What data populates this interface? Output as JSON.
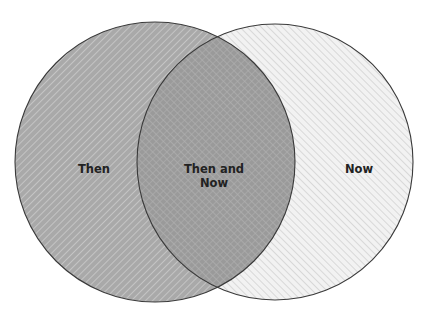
{
  "diagram": {
    "type": "venn",
    "sets": [
      {
        "id": "left",
        "label": "Then",
        "fill": "#a9a9a9",
        "hatch_color": "#c6c6c6",
        "hatch_direction": "backslash",
        "stroke": "#3a3a3a"
      },
      {
        "id": "right",
        "label": "Now",
        "fill": "#f1f1f1",
        "hatch_color": "#d0d0d0",
        "hatch_direction": "slash",
        "stroke": "#3a3a3a"
      }
    ],
    "intersection": {
      "label_line1": "Then and",
      "label_line2": "Now",
      "fill": "#959595"
    },
    "geometry": {
      "left_circle": {
        "cx": 155,
        "cy": 162,
        "r": 140
      },
      "right_circle": {
        "cx": 275,
        "cy": 162,
        "r": 138
      }
    }
  }
}
